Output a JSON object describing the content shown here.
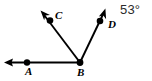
{
  "figure": {
    "kind": "geometry-diagram",
    "width": 152,
    "height": 81,
    "background_color": "#ffffff",
    "stroke_color": "#000000",
    "annotation_color": "#2b2b2b",
    "vertex_label": "B",
    "points": [
      {
        "id": "A",
        "label": "A",
        "x": 27,
        "y": 62,
        "dot": true
      },
      {
        "id": "B",
        "label": "B",
        "x": 80,
        "y": 63,
        "dot": true
      },
      {
        "id": "C",
        "label": "C",
        "x": 50,
        "y": 20,
        "dot": true
      },
      {
        "id": "D",
        "label": "D",
        "x": 100,
        "y": 21,
        "dot": true
      }
    ],
    "rays": [
      {
        "id": "ray-BA",
        "name": "ray-BA",
        "from": "B",
        "through": "A",
        "arrow_tip": {
          "x": 5,
          "y": 62
        },
        "direction": "left"
      },
      {
        "id": "ray-BC",
        "name": "ray-BC",
        "from": "B",
        "through": "C",
        "arrow_tip": {
          "x": 41,
          "y": 12
        },
        "direction": "up-left"
      },
      {
        "id": "ray-BD",
        "name": "ray-BD",
        "from": "B",
        "through": "D",
        "arrow_tip": {
          "x": 105,
          "y": 9
        },
        "direction": "up-right"
      }
    ],
    "annotations": {
      "angle_measure": "53°"
    }
  }
}
